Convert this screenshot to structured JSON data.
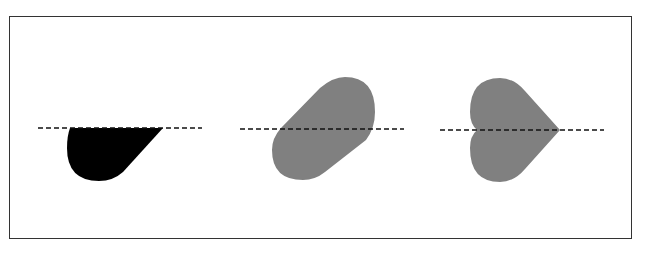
{
  "diagram": {
    "title": "",
    "panels": [
      {
        "id": "panel-1",
        "label": "",
        "shape": "half-teardrop-below-line",
        "fill": "#000000"
      },
      {
        "id": "panel-2",
        "label": "",
        "shape": "rotated-stadium-capsule",
        "fill": "#808080"
      },
      {
        "id": "panel-3",
        "label": "",
        "shape": "sideways-heart",
        "fill": "#808080"
      }
    ],
    "reference_line": {
      "style": "dashed",
      "color": "#111111"
    },
    "colors": {
      "border": "#333333",
      "background": "#ffffff",
      "dark_fill": "#000000",
      "gray_fill": "#808080"
    }
  }
}
